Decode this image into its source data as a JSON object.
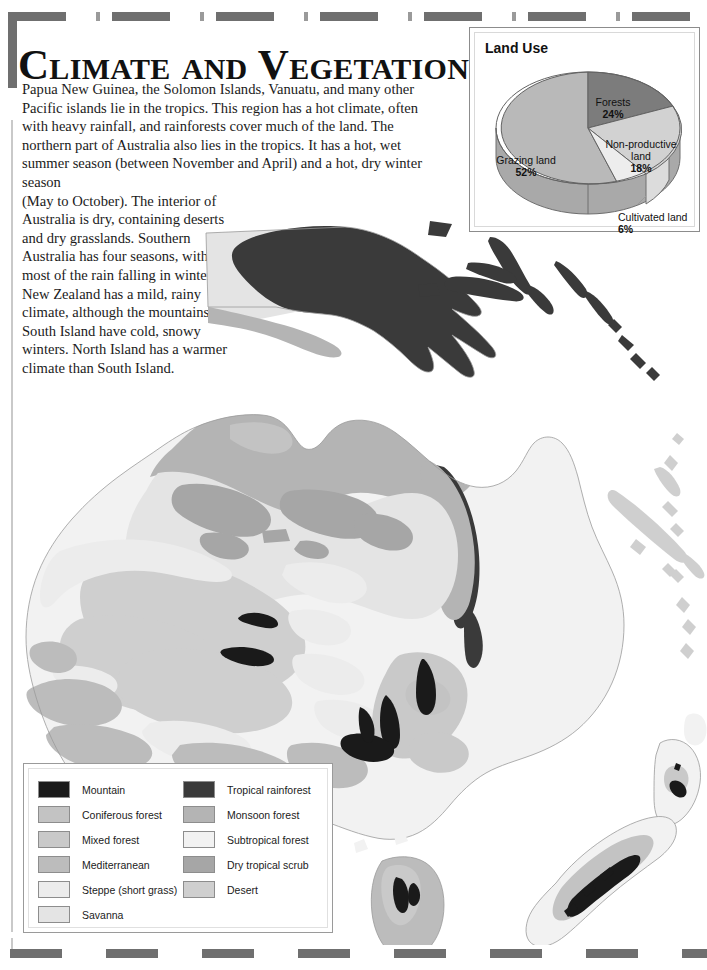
{
  "page": {
    "title": "Climate and Vegetation",
    "background": "#ffffff"
  },
  "article": {
    "paragraph_wide": "Papua New Guinea, the Solomon Islands, Vanuatu, and many other Pacific islands lie in the tropics. This region has a hot climate, often with heavy rainfall, and rainforests cover much of the land. The northern part of Australia also lies in the tropics. It has a hot, wet summer season (between November and April) and a hot, dry winter season",
    "paragraph_narrow": "(May to October). The interior of Australia is dry, containing deserts and dry grasslands. Southern Australia has four seasons, with most of the rain falling in winter. New Zealand has a mild, rainy climate, although the mountains in South Island have cold, snowy winters. North Island has a warmer climate than South Island."
  },
  "land_use_panel": {
    "title": "Land Use"
  },
  "chart_data": {
    "type": "pie",
    "title": "Land Use",
    "categories": [
      "Grazing land",
      "Forests",
      "Non-productive land",
      "Cultivated land"
    ],
    "values": [
      52,
      24,
      18,
      6
    ],
    "value_unit": "%",
    "labels": [
      {
        "name": "Grazing land",
        "value": "52%",
        "color": "#b9b9b9"
      },
      {
        "name": "Forests",
        "value": "24%",
        "color": "#7c7c7c"
      },
      {
        "name": "Non-productive land",
        "value": "18%",
        "color": "#d2d2d2"
      },
      {
        "name": "Cultivated land",
        "value": "6%",
        "color": "#ededed"
      }
    ],
    "legend_position": "inline-labels",
    "three_d": true,
    "grid": false,
    "xlabel": "",
    "ylabel": ""
  },
  "map_legend": {
    "column_left": [
      {
        "label": "Mountain",
        "color": "#1a1a1a"
      },
      {
        "label": "Coniferous forest",
        "color": "#c3c3c3"
      },
      {
        "label": "Mixed forest",
        "color": "#c9c9c9"
      },
      {
        "label": "Mediterranean",
        "color": "#bcbcbc"
      },
      {
        "label": "Steppe (short grass)",
        "color": "#ececec"
      },
      {
        "label": "Savanna",
        "color": "#e4e4e4"
      }
    ],
    "column_right": [
      {
        "label": "Tropical rainforest",
        "color": "#3a3a3a"
      },
      {
        "label": "Monsoon forest",
        "color": "#b4b4b4"
      },
      {
        "label": "Subtropical forest",
        "color": "#f2f2f2"
      },
      {
        "label": "Dry tropical scrub",
        "color": "#a6a6a6"
      },
      {
        "label": "Desert",
        "color": "#cfcfcf"
      }
    ]
  },
  "map": {
    "name": "oceania-vegetation-map",
    "regions": [
      "Papua New Guinea",
      "Solomon Islands",
      "Vanuatu",
      "New Caledonia",
      "Australia",
      "Tasmania",
      "New Zealand North Island",
      "New Zealand South Island"
    ]
  }
}
